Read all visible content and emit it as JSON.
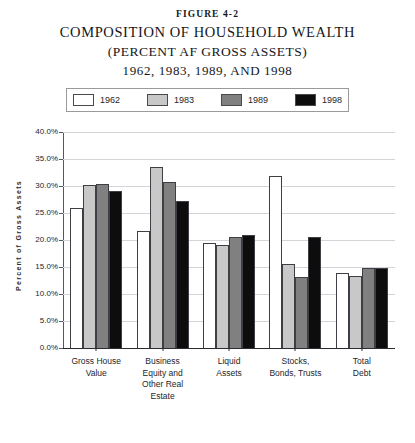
{
  "figure": {
    "number": "FIGURE 4-2",
    "title_line1": "COMPOSITION OF HOUSEHOLD WEALTH",
    "title_line2": "(PERCENT AF GROSS ASSETS)",
    "title_line3": "1962, 1983, 1989, AND 1998"
  },
  "legend": {
    "position": "top",
    "items": [
      {
        "label": "1962",
        "color": "#ffffff"
      },
      {
        "label": "1983",
        "color": "#c8c8c8"
      },
      {
        "label": "1989",
        "color": "#808080"
      },
      {
        "label": "1998",
        "color": "#0d0d0d"
      }
    ]
  },
  "axis": {
    "ylabel": "Percent of Gross Assets",
    "yticks": [
      "0.0%",
      "5.0%",
      "10.0%",
      "15.0%",
      "20.0%",
      "25.0%",
      "30.0%",
      "35.0%",
      "40.0%"
    ]
  },
  "chart_data": {
    "type": "bar",
    "title": "Composition of Household Wealth (Percent af Gross Assets) 1962, 1983, 1989, and 1998",
    "xlabel": "",
    "ylabel": "Percent of Gross Assets",
    "ylim": [
      0,
      40
    ],
    "ytick_step": 5,
    "ytick_format": "percent",
    "grid": true,
    "legend_position": "top",
    "categories": [
      "Gross House Value",
      "Business Equity and Other Real Estate",
      "Liquid Assets",
      "Stocks, Bonds, Trusts",
      "Total Debt"
    ],
    "category_label_lines": [
      [
        "Gross House",
        "Value"
      ],
      [
        "Business",
        "Equity and",
        "Other Real",
        "Estate"
      ],
      [
        "Liquid",
        "Assets"
      ],
      [
        "Stocks,",
        "Bonds, Trusts"
      ],
      [
        "Total",
        "Debt"
      ]
    ],
    "series": [
      {
        "name": "1962",
        "color": "#ffffff",
        "values": [
          26.0,
          21.7,
          19.5,
          31.9,
          13.8
        ]
      },
      {
        "name": "1983",
        "color": "#c8c8c8",
        "values": [
          30.1,
          33.5,
          19.1,
          15.5,
          13.3
        ]
      },
      {
        "name": "1989",
        "color": "#808080",
        "values": [
          30.4,
          30.8,
          20.5,
          13.2,
          14.8
        ]
      },
      {
        "name": "1998",
        "color": "#0d0d0d",
        "values": [
          29.0,
          27.3,
          21.0,
          20.5,
          14.8
        ]
      }
    ]
  }
}
